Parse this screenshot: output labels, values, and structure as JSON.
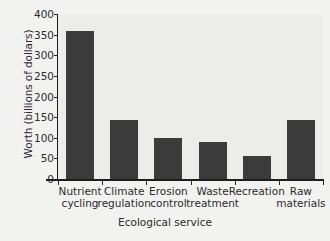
{
  "chart_data": {
    "type": "bar",
    "title": "",
    "xlabel": "Ecological service",
    "ylabel": "Worth (billions of dollars)",
    "categories": [
      "Nutrient cycling",
      "Climate regulation",
      "Erosion control",
      "Waste treatment",
      "Recreation",
      "Raw materials"
    ],
    "category_lines": [
      [
        "Nutrient",
        "cycling"
      ],
      [
        "Climate",
        "regulation"
      ],
      [
        "Erosion",
        "control"
      ],
      [
        "Waste",
        "treatment"
      ],
      [
        "Recreation",
        ""
      ],
      [
        "Raw",
        "materials"
      ]
    ],
    "values": [
      360,
      142,
      100,
      90,
      55,
      142
    ],
    "ylim": [
      0,
      400
    ],
    "yticks": [
      0,
      50,
      100,
      150,
      200,
      250,
      300,
      350,
      400
    ],
    "ytick_labels": [
      "0",
      "50",
      "100",
      "150",
      "200",
      "250",
      "300",
      "350",
      "400"
    ],
    "grid": false,
    "legend": "none",
    "bar_color": "#3b3b3b",
    "plot_background": "#ececeb",
    "page_background": "#f2f2f1",
    "axis_color": "#1d1d1d"
  }
}
